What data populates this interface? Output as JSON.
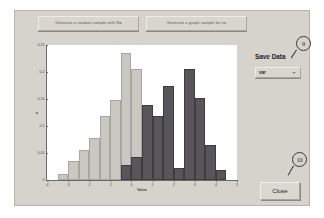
{
  "dialog": {
    "buttons": {
      "generate_sample": "Generate a random sample with N=",
      "generate_plot": "Generate a graph sample for n="
    },
    "save_data": {
      "label": "Save Data",
      "variable_field": "var",
      "dropdown_icon": "chevron-down-icon"
    },
    "close_button": "Close",
    "callouts": [
      {
        "id": "9",
        "label": "9"
      },
      {
        "id": "10",
        "label": "10"
      }
    ]
  },
  "chart_data": {
    "type": "bar",
    "title": "",
    "xlabel": "Value",
    "ylabel": "n",
    "xlim": [
      -4,
      5
    ],
    "ylim": [
      0,
      0.25
    ],
    "grid": false,
    "legend": "none",
    "bin_width": 0.5,
    "xticks": [
      "-4",
      "-3",
      "-2",
      "-1",
      "0",
      "1",
      "2",
      "3",
      "4",
      "5"
    ],
    "yticks": [
      "0",
      "0.05",
      "0.1",
      "0.15",
      "0.2",
      "0.25"
    ],
    "colors": {
      "series1": "#c9c7c2",
      "series2": "#58565a"
    },
    "bin_centers": [
      -3.25,
      -2.75,
      -2.25,
      -1.75,
      -1.25,
      -0.75,
      -0.25,
      0.25,
      0.75,
      1.25,
      1.75,
      2.25,
      2.75,
      3.25,
      3.75,
      4.25
    ],
    "series": [
      {
        "name": "Sample 1",
        "color": "#c9c7c2",
        "values": [
          0.012,
          0.035,
          0.055,
          0.078,
          0.118,
          0.148,
          0.235,
          0.205,
          0.0,
          0.0,
          0.0,
          0.0,
          0.0,
          0.0,
          0.0,
          0.0
        ]
      },
      {
        "name": "Sample 2",
        "color": "#58565a",
        "values": [
          0.0,
          0.0,
          0.0,
          0.0,
          0.0,
          0.0,
          0.028,
          0.043,
          0.138,
          0.118,
          0.175,
          0.023,
          0.205,
          0.152,
          0.065,
          0.018
        ]
      }
    ]
  }
}
